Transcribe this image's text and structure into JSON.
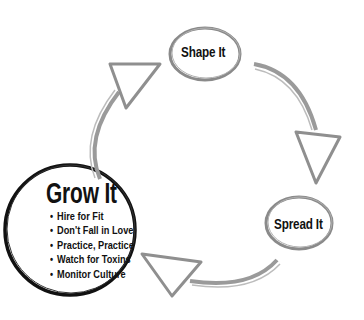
{
  "diagram": {
    "type": "cycle",
    "nodes": [
      {
        "id": "shape",
        "label": "Shape It"
      },
      {
        "id": "spread",
        "label": "Spread It"
      },
      {
        "id": "grow",
        "label": "Grow It",
        "bullets": [
          "Hire for Fit",
          "Don't Fall in Love",
          "Practice, Practice",
          "Watch for Toxins",
          "Monitor Culture"
        ]
      }
    ],
    "edges": [
      {
        "from": "shape",
        "to": "spread"
      },
      {
        "from": "spread",
        "to": "grow"
      },
      {
        "from": "grow",
        "to": "shape"
      }
    ],
    "colors": {
      "arrow": "#9a9a9a",
      "node_outline": "#8c8c8c",
      "grow_outline": "#111111",
      "text": "#111111"
    }
  }
}
